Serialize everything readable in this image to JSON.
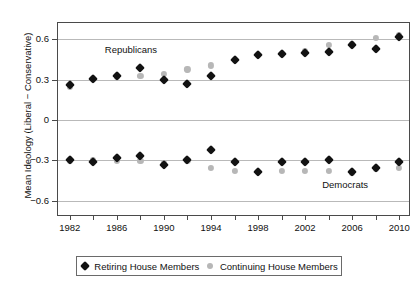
{
  "chart_data": {
    "type": "scatter",
    "title": "",
    "xlabel": "",
    "ylabel": "Mean Ideology (Liberal − Conservative)",
    "xlim": [
      1981,
      2011
    ],
    "ylim": [
      -0.72,
      0.72
    ],
    "grid": true,
    "legend_position": "bottom",
    "x": [
      1982,
      1984,
      1986,
      1988,
      1990,
      1992,
      1994,
      1996,
      1998,
      2000,
      2002,
      2004,
      2006,
      2008,
      2010
    ],
    "x_tick_values": [
      1982,
      1984,
      1986,
      1988,
      1990,
      1992,
      1994,
      1996,
      1998,
      2000,
      2002,
      2004,
      2006,
      2008,
      2010
    ],
    "x_tick_labels": [
      "1982",
      "",
      "1986",
      "",
      "1990",
      "",
      "1994",
      "",
      "1998",
      "",
      "2002",
      "",
      "2006",
      "",
      "2010"
    ],
    "y_tick_values": [
      0.6,
      0.3,
      0,
      -0.3,
      -0.6
    ],
    "y_tick_labels": [
      "0.6",
      "0.3",
      "0",
      "−0.3",
      "−0.6"
    ],
    "annotations": [
      {
        "text": "Republicans",
        "x": 1987.2,
        "y": 0.525
      },
      {
        "text": "Democrats",
        "x": 2005.4,
        "y": -0.478
      }
    ],
    "series": [
      {
        "name": "Retiring House Members",
        "group": "Republicans",
        "marker": "diamond",
        "color": "#121212",
        "values": [
          0.26,
          0.305,
          0.325,
          0.385,
          0.295,
          0.27,
          0.325,
          0.445,
          0.485,
          0.49,
          0.5,
          0.505,
          0.555,
          0.525,
          0.615
        ]
      },
      {
        "name": "Continuing House Members",
        "group": "Republicans",
        "marker": "circle",
        "color": "#b7b7b7",
        "values": [
          0.25,
          0.305,
          0.32,
          0.325,
          0.345,
          0.375,
          0.405,
          0.445,
          0.485,
          0.49,
          0.515,
          0.555,
          0.565,
          0.61,
          0.63
        ]
      },
      {
        "name": "Retiring House Members",
        "group": "Democrats",
        "marker": "diamond",
        "color": "#121212",
        "values": [
          -0.3,
          -0.315,
          -0.285,
          -0.265,
          -0.335,
          -0.3,
          -0.225,
          -0.315,
          -0.385,
          -0.31,
          -0.31,
          -0.295,
          -0.385,
          -0.355,
          -0.31
        ]
      },
      {
        "name": "Continuing House Members",
        "group": "Democrats",
        "marker": "circle",
        "color": "#b7b7b7",
        "values": [
          -0.3,
          -0.3,
          -0.3,
          -0.305,
          -0.32,
          -0.3,
          -0.355,
          -0.375,
          -0.385,
          -0.375,
          -0.375,
          -0.375,
          -0.39,
          -0.36,
          -0.355
        ]
      }
    ],
    "legend": [
      {
        "label": "Retiring House Members",
        "marker": "diamond",
        "color": "#121212"
      },
      {
        "label": "Continuing House Members",
        "marker": "circle",
        "color": "#b7b7b7"
      }
    ]
  }
}
